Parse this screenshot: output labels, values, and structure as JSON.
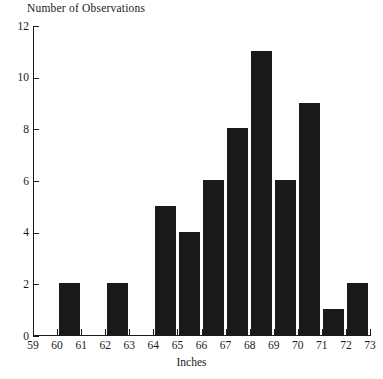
{
  "chart_data": {
    "type": "bar",
    "title": "",
    "ylabel": "Number of Observations",
    "xlabel": "Inches",
    "grid": false,
    "legend": null,
    "bar_color": "#1a1a1a",
    "axis_color": "#1a1a1a",
    "bin_edges": [
      59,
      60,
      61,
      62,
      63,
      64,
      65,
      66,
      67,
      68,
      69,
      70,
      71,
      72,
      73
    ],
    "categories": [
      "59-60",
      "60-61",
      "61-62",
      "62-63",
      "63-64",
      "64-65",
      "65-66",
      "66-67",
      "67-68",
      "68-69",
      "69-70",
      "70-71",
      "71-72",
      "72-73"
    ],
    "values": [
      0,
      2,
      0,
      2,
      0,
      5,
      4,
      6,
      8,
      11,
      6,
      9,
      1,
      2
    ],
    "xlim": [
      59,
      73
    ],
    "ylim": [
      0,
      12
    ],
    "xticks": [
      59,
      60,
      61,
      62,
      63,
      64,
      65,
      66,
      67,
      68,
      69,
      70,
      71,
      72,
      73
    ],
    "xtick_labels": [
      "59",
      "60",
      "61",
      "62",
      "63",
      "64",
      "65",
      "66",
      "67",
      "68",
      "69",
      "70",
      "71",
      "72",
      "73"
    ],
    "yticks": [
      0,
      2,
      4,
      6,
      8,
      10,
      12
    ],
    "ytick_labels": [
      "0",
      "2",
      "4",
      "6",
      "8",
      "10",
      "12"
    ]
  }
}
